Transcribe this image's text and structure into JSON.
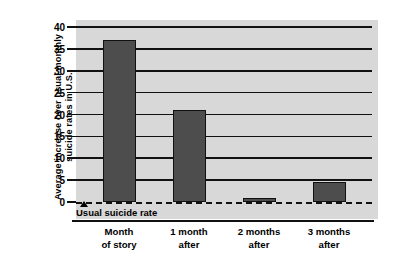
{
  "chart_data": {
    "type": "bar",
    "title": "",
    "subtitle": "",
    "xlabel": "",
    "ylabel_lines": [
      "Average increase over usual monthly",
      "suicide rates in U.S."
    ],
    "ylabel": "Average increase over usual monthly suicide rates in U.S.",
    "categories": [
      "Month of story",
      "1 month after",
      "2 months after",
      "3 months after"
    ],
    "category_lines": [
      [
        "Month",
        "of story"
      ],
      [
        "1 month",
        "after"
      ],
      [
        "2 months",
        "after"
      ],
      [
        "3 months",
        "after"
      ]
    ],
    "values": [
      37,
      21,
      1,
      4.5
    ],
    "ylim": [
      0,
      40
    ],
    "yticks": [
      0,
      5,
      10,
      15,
      20,
      25,
      30,
      35,
      40
    ],
    "ytick_labels": [
      "0",
      "5",
      "10",
      "15",
      "20",
      "25",
      "30",
      "35",
      "40"
    ],
    "grid": true,
    "legend": false,
    "annotations": [
      {
        "name": "usual-suicide-rate",
        "text": "Usual suicide rate",
        "value": 0,
        "marker": "triangle-up"
      }
    ],
    "colors": {
      "bar_fill": "#4d4d4d",
      "bar_edge": "#111111",
      "plot_background": "#d8d8d8",
      "gridline": "#111111",
      "zero_line": "#111111",
      "text": "#000000",
      "figure_background": "#ffffff"
    }
  }
}
